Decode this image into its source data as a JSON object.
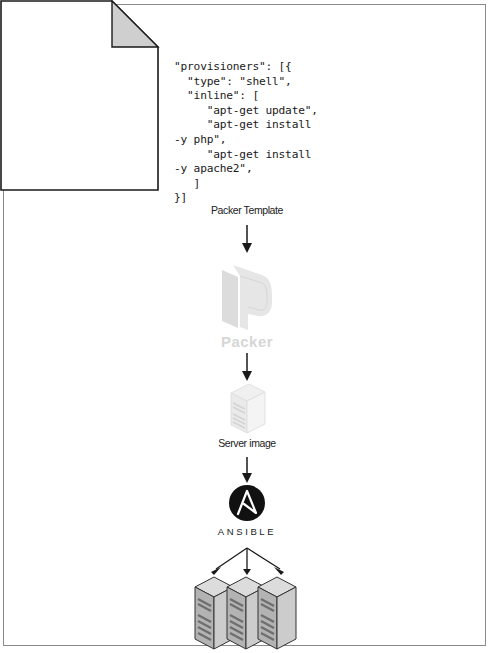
{
  "diagram": {
    "template_code": "\"provisioners\": [{\n  \"type\": \"shell\",\n  \"inline\": [\n     \"apt-get update\",\n     \"apt-get install\n-y php\",\n     \"apt-get install\n-y apache2\",\n   ]\n}]",
    "template_label": "Packer Template",
    "packer_label": "Packer",
    "server_image_label": "Server image",
    "ansible_label": "ANSIBLE",
    "colors": {
      "frame": "#8a8a8a",
      "arrow": "#1a1a1a",
      "doc_fold": "#cfcfcf",
      "packer_logo": "#e0e0e0",
      "ansible_circle": "#111111",
      "server_gray": "#bdbdbd"
    }
  }
}
